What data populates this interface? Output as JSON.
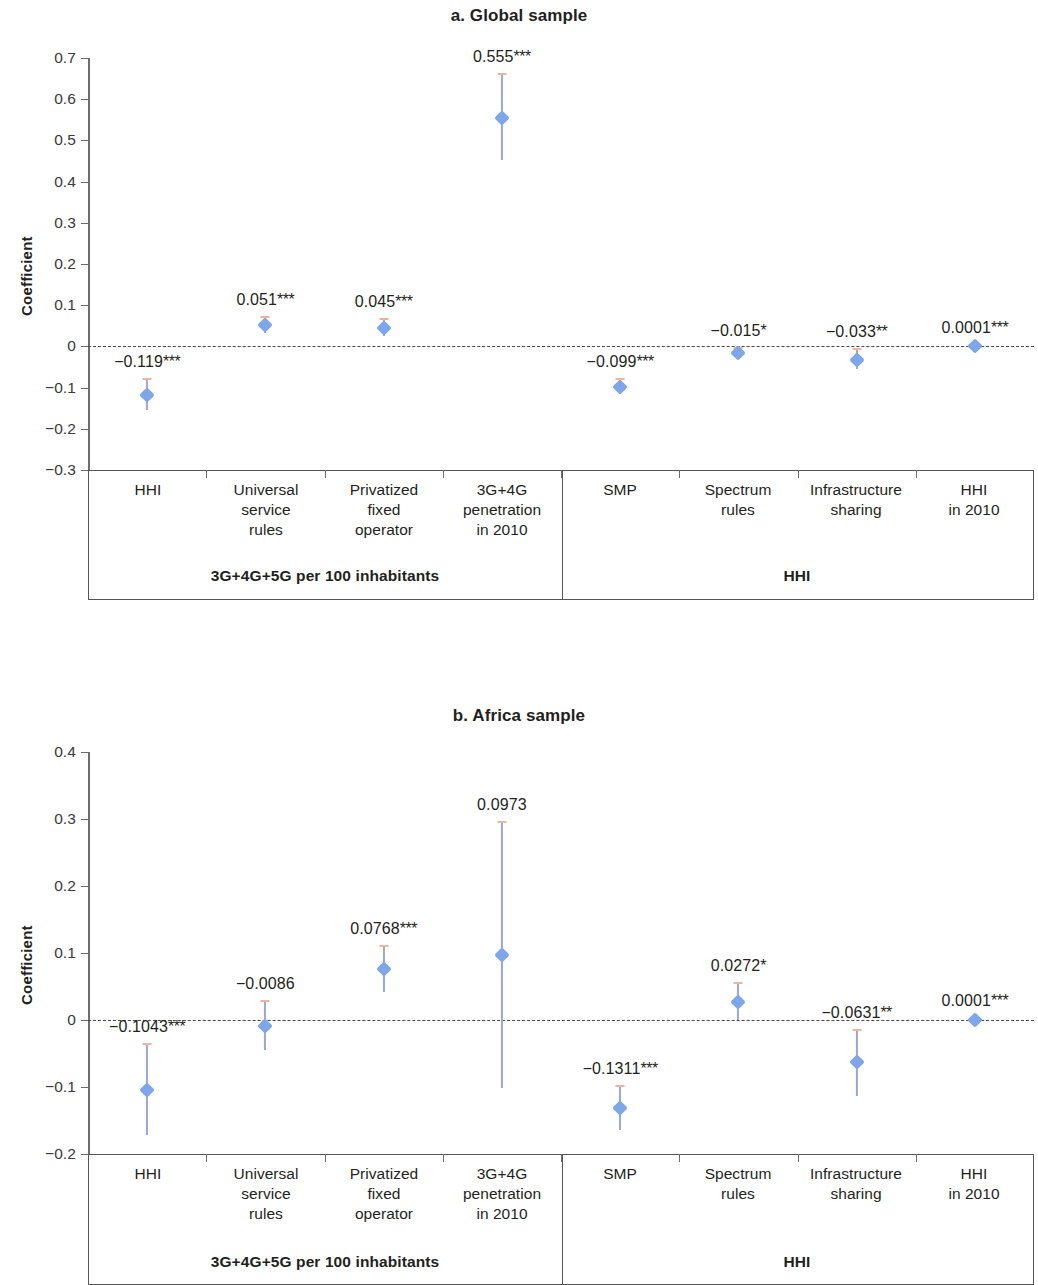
{
  "figure": {
    "panels": [
      {
        "id": "global",
        "title": "a. Global sample",
        "ylabel": "Coefficient"
      },
      {
        "id": "africa",
        "title": "b. Africa sample",
        "ylabel": "Coefficient"
      }
    ],
    "groups": [
      {
        "label": "3G+4G+5G per 100 inhabitants",
        "span": 4
      },
      {
        "label": "HHI",
        "span": 4
      }
    ]
  },
  "chart_data": [
    {
      "type": "scatter",
      "title": "a. Global sample",
      "xlabel": "",
      "ylabel": "Coefficient",
      "ylim": [
        -0.3,
        0.7
      ],
      "yticks": [
        "0.7",
        "0.6",
        "0.5",
        "0.4",
        "0.3",
        "0.2",
        "0.1",
        "0",
        "−0.1",
        "−0.2",
        "−0.3"
      ],
      "ytick_values": [
        0.7,
        0.6,
        0.5,
        0.4,
        0.3,
        0.2,
        0.1,
        0,
        -0.1,
        -0.2,
        -0.3
      ],
      "grid": false,
      "legend": "none",
      "zero_reference_line": 0,
      "group_labels": [
        "3G+4G+5G per 100 inhabitants",
        "HHI"
      ],
      "categories": [
        "HHI",
        "Universal service rules",
        "Privatized fixed operator",
        "3G+4G penetration in 2010",
        "SMP",
        "Spectrum rules",
        "Infrastructure sharing",
        "HHI in 2010"
      ],
      "category_lines": [
        [
          "HHI"
        ],
        [
          "Universal",
          "service",
          "rules"
        ],
        [
          "Privatized",
          "fixed",
          "operator"
        ],
        [
          "3G+4G",
          "penetration",
          "in 2010"
        ],
        [
          "SMP"
        ],
        [
          "Spectrum",
          "rules"
        ],
        [
          "Infrastructure",
          "sharing"
        ],
        [
          "HHI",
          "in 2010"
        ]
      ],
      "points": [
        {
          "category": "HHI",
          "value": -0.119,
          "label": "−0.119",
          "stars": "***",
          "ci_low": -0.155,
          "ci_high": -0.078,
          "label_pos": "above"
        },
        {
          "category": "Universal service rules",
          "value": 0.051,
          "label": "0.051",
          "stars": "***",
          "ci_low": 0.033,
          "ci_high": 0.071,
          "label_pos": "above"
        },
        {
          "category": "Privatized fixed operator",
          "value": 0.045,
          "label": "0.045",
          "stars": "***",
          "ci_low": 0.024,
          "ci_high": 0.067,
          "label_pos": "above"
        },
        {
          "category": "3G+4G penetration in 2010",
          "value": 0.555,
          "label": "0.555",
          "stars": "***",
          "ci_low": 0.453,
          "ci_high": 0.662,
          "label_pos": "above"
        },
        {
          "category": "SMP",
          "value": -0.099,
          "label": "−0.099",
          "stars": "***",
          "ci_low": -0.115,
          "ci_high": -0.08,
          "label_pos": "above"
        },
        {
          "category": "Spectrum rules",
          "value": -0.015,
          "label": "−0.015",
          "stars": "*",
          "ci_low": -0.027,
          "ci_high": -0.003,
          "label_pos": "above"
        },
        {
          "category": "Infrastructure sharing",
          "value": -0.033,
          "label": "−0.033",
          "stars": "**",
          "ci_low": -0.055,
          "ci_high": -0.006,
          "label_pos": "above"
        },
        {
          "category": "HHI in 2010",
          "value": 0.0001,
          "label": "0.0001",
          "stars": "***",
          "ci_low": -0.004,
          "ci_high": 0.004,
          "label_pos": "above"
        }
      ]
    },
    {
      "type": "scatter",
      "title": "b. Africa sample",
      "xlabel": "",
      "ylabel": "Coefficient",
      "ylim": [
        -0.2,
        0.4
      ],
      "yticks": [
        "0.4",
        "0.3",
        "0.2",
        "0.1",
        "0",
        "−0.1",
        "−0.2"
      ],
      "ytick_values": [
        0.4,
        0.3,
        0.2,
        0.1,
        0,
        -0.1,
        -0.2
      ],
      "grid": false,
      "legend": "none",
      "zero_reference_line": 0,
      "group_labels": [
        "3G+4G+5G per 100 inhabitants",
        "HHI"
      ],
      "categories": [
        "HHI",
        "Universal service rules",
        "Privatized fixed operator",
        "3G+4G penetration in 2010",
        "SMP",
        "Spectrum rules",
        "Infrastructure sharing",
        "HHI in 2010"
      ],
      "category_lines": [
        [
          "HHI"
        ],
        [
          "Universal",
          "service",
          "rules"
        ],
        [
          "Privatized",
          "fixed",
          "operator"
        ],
        [
          "3G+4G",
          "penetration",
          "in 2010"
        ],
        [
          "SMP"
        ],
        [
          "Spectrum",
          "rules"
        ],
        [
          "Infrastructure",
          "sharing"
        ],
        [
          "HHI",
          "in 2010"
        ]
      ],
      "points": [
        {
          "category": "HHI",
          "value": -0.1043,
          "label": "−0.1043",
          "stars": "***",
          "ci_low": -0.172,
          "ci_high": -0.036,
          "label_pos": "above"
        },
        {
          "category": "Universal service rules",
          "value": -0.0086,
          "label": "−0.0086",
          "stars": "",
          "ci_low": -0.045,
          "ci_high": 0.028,
          "label_pos": "above"
        },
        {
          "category": "Privatized fixed operator",
          "value": 0.0768,
          "label": "0.0768",
          "stars": "***",
          "ci_low": 0.042,
          "ci_high": 0.111,
          "label_pos": "above"
        },
        {
          "category": "3G+4G penetration in 2010",
          "value": 0.0973,
          "label": "0.0973",
          "stars": "",
          "ci_low": -0.101,
          "ci_high": 0.296,
          "label_pos": "above"
        },
        {
          "category": "SMP",
          "value": -0.1311,
          "label": "−0.1311",
          "stars": "***",
          "ci_low": -0.164,
          "ci_high": -0.099,
          "label_pos": "above"
        },
        {
          "category": "Spectrum rules",
          "value": 0.0272,
          "label": "0.0272",
          "stars": "*",
          "ci_low": 0.0,
          "ci_high": 0.055,
          "label_pos": "above"
        },
        {
          "category": "Infrastructure sharing",
          "value": -0.0631,
          "label": "−0.0631",
          "stars": "**",
          "ci_low": -0.114,
          "ci_high": -0.015,
          "label_pos": "above"
        },
        {
          "category": "HHI in 2010",
          "value": 0.0001,
          "label": "0.0001",
          "stars": "***",
          "ci_low": -0.002,
          "ci_high": 0.003,
          "label_pos": "above"
        }
      ]
    }
  ],
  "style": {
    "marker_color": "#7da7e8",
    "line_color": "#98a8da",
    "cap_color": "#f0b49a",
    "axis_color": "#6d6d6d",
    "text_color": "#231f20",
    "background": "#ffffff"
  }
}
